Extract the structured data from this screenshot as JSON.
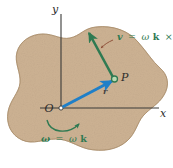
{
  "figure": {
    "background_color": "#ffffff",
    "body_fill_color": "#cdb293",
    "body_edge_color": "#9d8264",
    "axis_color": "#3a3a38",
    "labels": {
      "y_axis": "y",
      "x_axis": "x",
      "origin": "O",
      "point_p": "P",
      "position_vector": "r"
    },
    "vectors": {
      "position": {
        "name": "r",
        "color": "#1f7fc8",
        "from": "O",
        "to": "P"
      },
      "velocity": {
        "name": "v",
        "color": "#2f7a52",
        "from": "P",
        "direction": "up-left, perpendicular to r"
      }
    },
    "annotations": {
      "velocity_formula": {
        "lhs": "v",
        "equals": "=",
        "omega": "ω",
        "k": "k",
        "cross": "×",
        "r": "r",
        "full_text": "v = ωk × r",
        "color": "#2f7a52",
        "leader_color": "#8a4a33"
      },
      "angular_velocity": {
        "omega_bold": "ω",
        "equals": "=",
        "omega": "ω",
        "k": "k",
        "full_text": "ω = ωk",
        "color": "#2f7a52",
        "arc_arrow": "counterclockwise-arc-icon"
      }
    }
  }
}
